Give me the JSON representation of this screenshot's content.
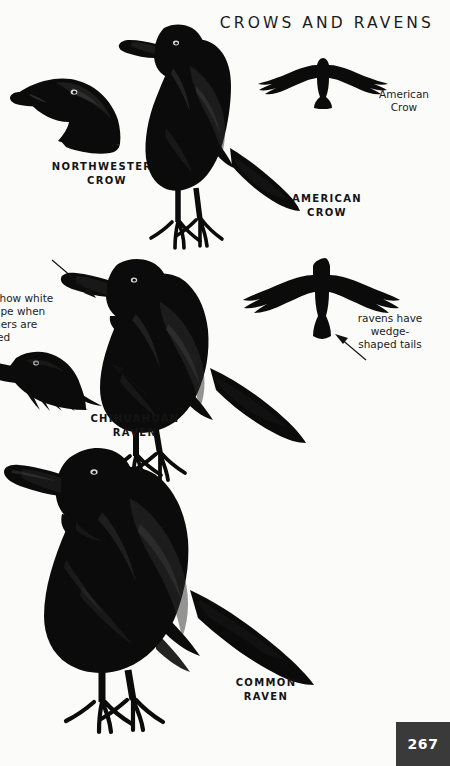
{
  "page": {
    "title": "CROWS AND RAVENS",
    "page_number": "267",
    "background_color": "#fbfbfa",
    "ink_color": "#0b0b0b",
    "page_number_block_color": "#3a3a3a"
  },
  "species_labels": [
    {
      "id": "northwestern-crow",
      "text": "NORTHWESTERN\nCROW"
    },
    {
      "id": "american-crow",
      "text": "AMERICAN\nCROW"
    },
    {
      "id": "chihuahuan-raven",
      "text": "CHIHUAHUAN\nRAVEN"
    },
    {
      "id": "common-raven",
      "text": "COMMON\nRAVEN"
    }
  ],
  "flight_labels": [
    {
      "id": "american-crow-flight",
      "text": "American\nCrow"
    }
  ],
  "callouts": [
    {
      "id": "white-napes-note",
      "text": "show white\nape when\nhers are\nled"
    },
    {
      "id": "wedge-tail-note",
      "text": "ravens have\nwedge-\nshaped tails"
    }
  ],
  "figures": [
    {
      "id": "northwestern-crow-head",
      "caption": "NORTHWESTERN CROW"
    },
    {
      "id": "american-crow-perched",
      "caption": "AMERICAN CROW"
    },
    {
      "id": "american-crow-flight",
      "caption": "American Crow"
    },
    {
      "id": "chihuahuan-raven-perched",
      "caption": "CHIHUAHUAN RAVEN"
    },
    {
      "id": "chihuahuan-raven-head-ruffled",
      "caption": ""
    },
    {
      "id": "raven-flight",
      "caption": ""
    },
    {
      "id": "common-raven-perched",
      "caption": "COMMON RAVEN"
    }
  ]
}
